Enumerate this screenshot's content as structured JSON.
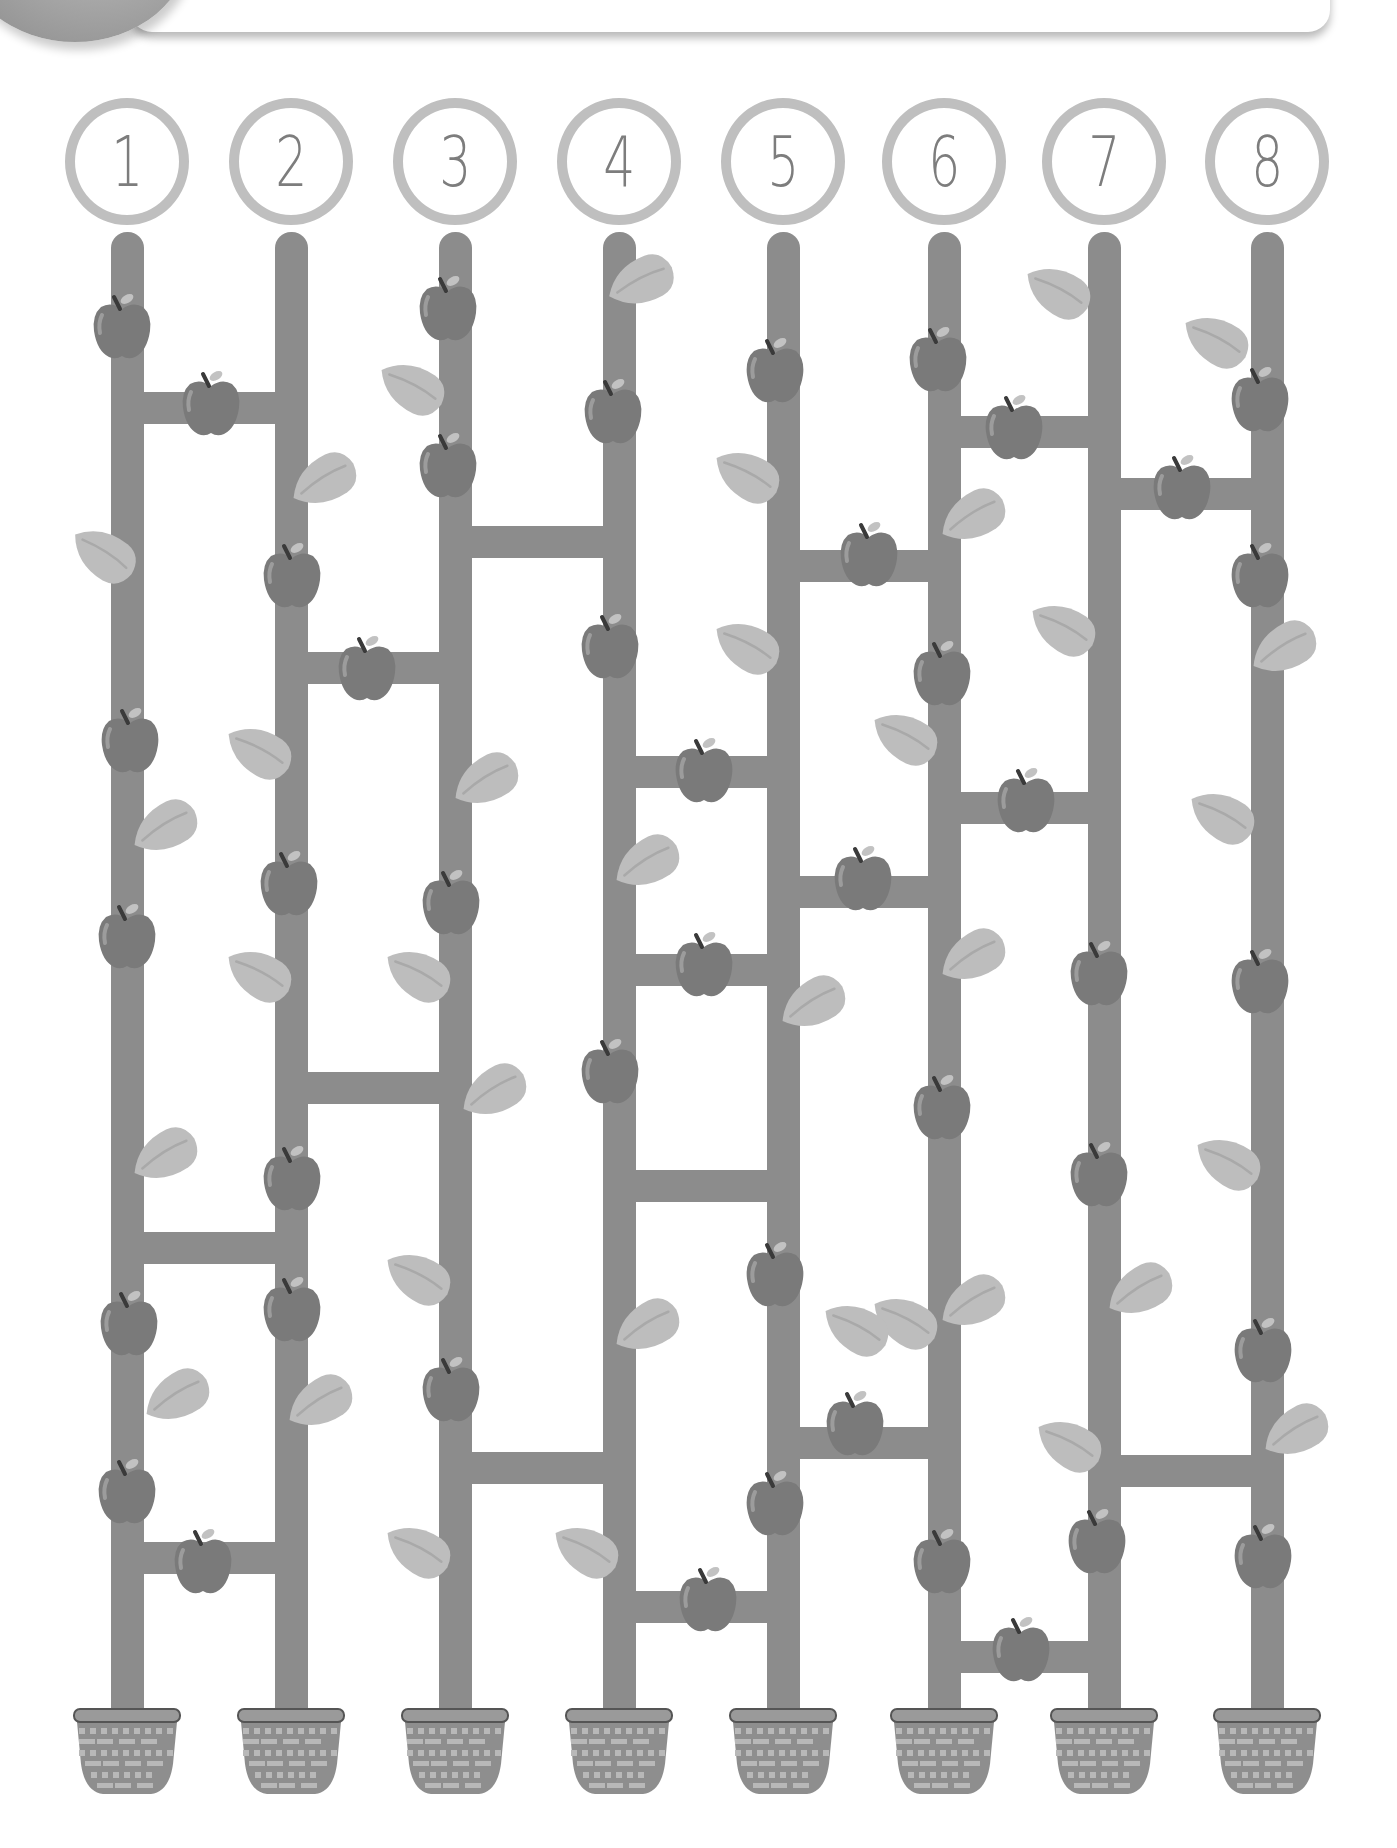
{
  "puzzle": {
    "type": "apple-tree ladder maze",
    "header_text": "",
    "start_labels": [
      "1",
      "2",
      "3",
      "4",
      "5",
      "6",
      "7",
      "8"
    ],
    "colors": {
      "pole": "#8c8c8c",
      "circle_ring": "#bfbfbf",
      "number": "#7d7d7d",
      "apple": "#7a7a7a",
      "apple_highlight": "#9c9c9c",
      "leaf": "#bdbdbd",
      "leaf_vein": "#a9a9a9",
      "basket": "#8e8e8e",
      "basket_weave": "#b8b8b8",
      "basket_rim": "#9a9a9a"
    },
    "column_x": [
      127,
      291,
      455,
      619,
      783,
      944,
      1104,
      1267
    ],
    "circle_y": 161,
    "pole_top": 232,
    "pole_bottom": 1712,
    "basket_top": 1706,
    "rungs": [
      {
        "from": 1,
        "to": 2,
        "y": 408
      },
      {
        "from": 1,
        "to": 2,
        "y": 1248
      },
      {
        "from": 1,
        "to": 2,
        "y": 1558
      },
      {
        "from": 2,
        "to": 3,
        "y": 668
      },
      {
        "from": 2,
        "to": 3,
        "y": 1088
      },
      {
        "from": 3,
        "to": 4,
        "y": 542
      },
      {
        "from": 3,
        "to": 4,
        "y": 1468
      },
      {
        "from": 4,
        "to": 5,
        "y": 772
      },
      {
        "from": 4,
        "to": 5,
        "y": 970
      },
      {
        "from": 4,
        "to": 5,
        "y": 1186
      },
      {
        "from": 4,
        "to": 5,
        "y": 1607
      },
      {
        "from": 5,
        "to": 6,
        "y": 566
      },
      {
        "from": 5,
        "to": 6,
        "y": 892
      },
      {
        "from": 5,
        "to": 6,
        "y": 1443
      },
      {
        "from": 6,
        "to": 7,
        "y": 432
      },
      {
        "from": 6,
        "to": 7,
        "y": 808
      },
      {
        "from": 6,
        "to": 7,
        "y": 1657
      },
      {
        "from": 7,
        "to": 8,
        "y": 494
      },
      {
        "from": 7,
        "to": 8,
        "y": 1471
      }
    ],
    "apples": [
      [
        122,
        326
      ],
      [
        130,
        740
      ],
      [
        127,
        936
      ],
      [
        129,
        1323
      ],
      [
        127,
        1491
      ],
      [
        211,
        403
      ],
      [
        203,
        1561
      ],
      [
        292,
        575
      ],
      [
        289,
        883
      ],
      [
        292,
        1178
      ],
      [
        292,
        1309
      ],
      [
        367,
        668
      ],
      [
        448,
        308
      ],
      [
        448,
        465
      ],
      [
        451,
        902
      ],
      [
        451,
        1389
      ],
      [
        613,
        411
      ],
      [
        610,
        646
      ],
      [
        610,
        1071
      ],
      [
        704,
        770
      ],
      [
        704,
        964
      ],
      [
        708,
        1599
      ],
      [
        775,
        370
      ],
      [
        775,
        1274
      ],
      [
        775,
        1503
      ],
      [
        869,
        554
      ],
      [
        863,
        878
      ],
      [
        855,
        1423
      ],
      [
        938,
        359
      ],
      [
        942,
        673
      ],
      [
        942,
        1107
      ],
      [
        942,
        1561
      ],
      [
        1014,
        427
      ],
      [
        1026,
        800
      ],
      [
        1021,
        1649
      ],
      [
        1099,
        973
      ],
      [
        1099,
        1174
      ],
      [
        1097,
        1541
      ],
      [
        1182,
        487
      ],
      [
        1260,
        399
      ],
      [
        1260,
        575
      ],
      [
        1260,
        981
      ],
      [
        1263,
        1350
      ],
      [
        1263,
        1556
      ]
    ],
    "leaves": [
      [
        103,
        554,
        35
      ],
      [
        164,
        828,
        -30
      ],
      [
        164,
        1156,
        -30
      ],
      [
        176,
        1397,
        -30
      ],
      [
        258,
        751,
        30
      ],
      [
        258,
        974,
        30
      ],
      [
        323,
        481,
        -30
      ],
      [
        319,
        1403,
        -30
      ],
      [
        411,
        387,
        30
      ],
      [
        485,
        781,
        -30
      ],
      [
        417,
        974,
        30
      ],
      [
        493,
        1092,
        -30
      ],
      [
        417,
        1277,
        30
      ],
      [
        417,
        1550,
        30
      ],
      [
        640,
        282,
        -25
      ],
      [
        646,
        863,
        -30
      ],
      [
        646,
        1327,
        -30
      ],
      [
        585,
        1550,
        30
      ],
      [
        746,
        475,
        30
      ],
      [
        746,
        646,
        30
      ],
      [
        812,
        1004,
        -30
      ],
      [
        904,
        737,
        30
      ],
      [
        904,
        1321,
        30
      ],
      [
        855,
        1328,
        30
      ],
      [
        972,
        517,
        -30
      ],
      [
        972,
        957,
        -30
      ],
      [
        972,
        1303,
        -30
      ],
      [
        1057,
        291,
        30
      ],
      [
        1062,
        628,
        30
      ],
      [
        1139,
        1291,
        -30
      ],
      [
        1068,
        1444,
        30
      ],
      [
        1215,
        340,
        30
      ],
      [
        1283,
        649,
        -30
      ],
      [
        1221,
        816,
        30
      ],
      [
        1227,
        1162,
        30
      ],
      [
        1295,
        1432,
        -30
      ]
    ],
    "basket_count": 8
  }
}
